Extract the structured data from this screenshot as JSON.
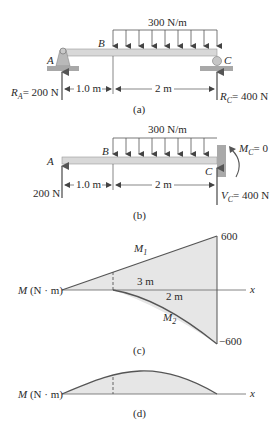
{
  "figure_a": {
    "caption": "(a)",
    "load_label": "300 N/m",
    "point_a": "A",
    "point_b": "B",
    "point_c": "C",
    "reaction_a": {
      "symbol": "R",
      "sub": "A",
      "value": "= 200 N"
    },
    "reaction_c": {
      "symbol": "R",
      "sub": "C",
      "value": "= 400 N"
    },
    "dim_ab": "1.0 m",
    "dim_bc": "2 m"
  },
  "figure_b": {
    "caption": "(b)",
    "load_label": "300 N/m",
    "point_a": "A",
    "point_b": "B",
    "point_c": "C",
    "force_a": "200 N",
    "moment_c": {
      "symbol": "M",
      "sub": "C",
      "value": "= 0"
    },
    "shear_c": {
      "symbol": "V",
      "sub": "C",
      "value": "= 400 N"
    },
    "dim_ab": "1.0 m",
    "dim_bc": "2 m"
  },
  "figure_c": {
    "caption": "(c)",
    "axis_label": "M (N · m)",
    "axis_var": "x",
    "m1_label": {
      "symbol": "M",
      "sub": "1"
    },
    "m2_label": {
      "symbol": "M",
      "sub": "2"
    },
    "top_value": "600",
    "bottom_value": "−600",
    "len_3m": "3 m",
    "len_2m": "2 m"
  },
  "figure_d": {
    "caption": "(d)",
    "axis_label": "M (N · m)",
    "axis_var": "x"
  },
  "colors": {
    "beam_fill": "#d8d8d8",
    "diagram_fill": "#e6e6e6",
    "line": "#555555",
    "ground": "#a8a8a8"
  }
}
